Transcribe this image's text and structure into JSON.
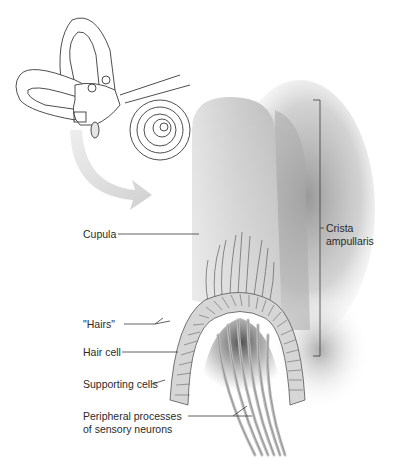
{
  "figure": {
    "type": "anatomical-illustration",
    "inset": "inner-ear-overview",
    "colors": {
      "background": "#ffffff",
      "line": "#3a3a3a",
      "cupula": "#c8c8c8",
      "arrow": "#d9d9d9",
      "shadow": "#9a9a9a"
    }
  },
  "labels": {
    "cupula": "Cupula",
    "hairs": "\"Hairs\"",
    "hair_cell": "Hair cell",
    "supporting_cells": "Supporting cells",
    "peripheral_line1": "Peripheral processes",
    "peripheral_line2": "of sensory neurons",
    "crista_line1": "Crista",
    "crista_line2": "ampullaris"
  }
}
